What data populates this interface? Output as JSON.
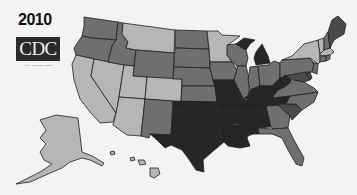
{
  "header": {
    "year": "2010",
    "logo_text": "CDC",
    "logo_tagline": "SAFER · HEALTHIER · PEOPLE"
  },
  "legend_classes": {
    "c1": {
      "label": "lowest",
      "color": "#b6b6b6"
    },
    "c2": {
      "label": "low-mid",
      "color": "#6f6f6f"
    },
    "c3": {
      "label": "high-mid",
      "color": "#4a4a4a"
    },
    "c4": {
      "label": "highest",
      "color": "#262626"
    }
  },
  "states": {
    "WA": "c2",
    "OR": "c2",
    "CA": "c1",
    "NV": "c1",
    "ID": "c2",
    "MT": "c1",
    "WY": "c2",
    "UT": "c1",
    "CO": "c1",
    "AZ": "c1",
    "NM": "c2",
    "ND": "c2",
    "SD": "c2",
    "NE": "c2",
    "KS": "c2",
    "OK": "c4",
    "TX": "c4",
    "MN": "c1",
    "IA": "c2",
    "MO": "c4",
    "AR": "c4",
    "LA": "c4",
    "WI": "c2",
    "IL": "c2",
    "MI": "c4",
    "IN": "c2",
    "OH": "c2",
    "KY": "c4",
    "TN": "c4",
    "MS": "c4",
    "AL": "c4",
    "GA": "c2",
    "FL": "c2",
    "SC": "c3",
    "NC": "c2",
    "VA": "c2",
    "WV": "c4",
    "PA": "c2",
    "NY": "c1",
    "VT": "c1",
    "NH": "c2",
    "ME": "c3",
    "MA": "c1",
    "CT": "c2",
    "RI": "c2",
    "NJ": "c2",
    "DE": "c3",
    "MD": "c3",
    "AK": "c1",
    "HI": "c1"
  }
}
